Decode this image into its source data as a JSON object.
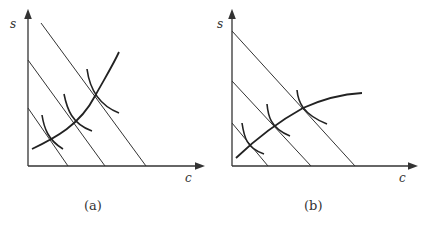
{
  "figure": {
    "panels": [
      {
        "id": "a",
        "caption": "(a)",
        "y_axis_label": "s",
        "x_axis_label": "c",
        "expansion_path": "convex (curving upward)"
      },
      {
        "id": "b",
        "caption": "(b)",
        "y_axis_label": "s",
        "x_axis_label": "c",
        "expansion_path": "concave (flattening out)"
      }
    ],
    "colors": {
      "line": "#333333",
      "curve": "#222222",
      "background": "#ffffff"
    }
  }
}
